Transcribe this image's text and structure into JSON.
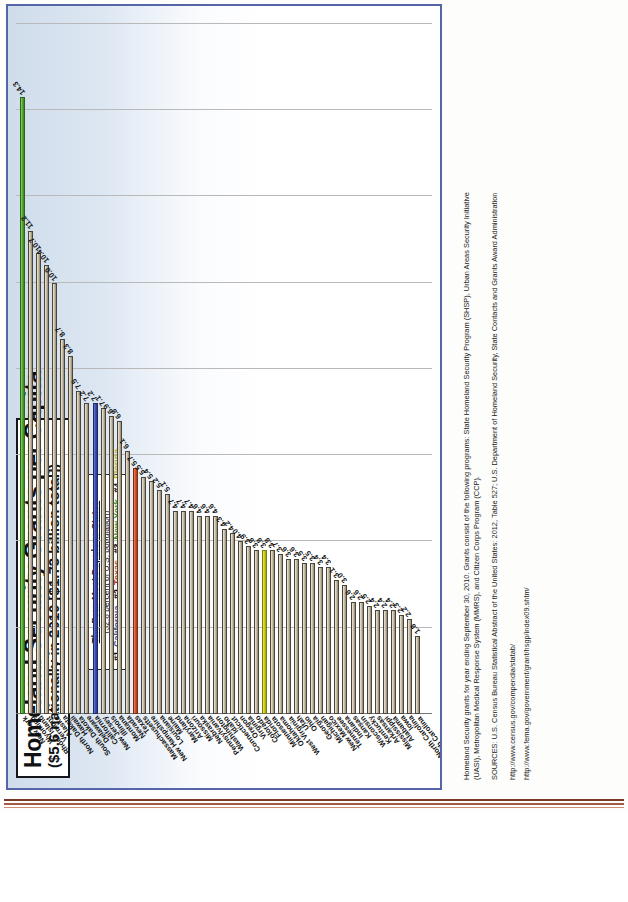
{
  "document": {
    "title_line1": "Homeland Security Grants per Capita",
    "title_line2": "($5.6 nationally in 2010 [$1.73 billion total])"
  },
  "legend": {
    "heading": "The Four Most Populous States",
    "subheading": "(32.8 percent of U.S. population)",
    "entries": [
      {
        "rank": "#1",
        "state": "California",
        "color": "#3b4ea8"
      },
      {
        "rank": "#2",
        "state": "Texas",
        "color": "#c0392b"
      },
      {
        "rank": "#3",
        "state": "New York",
        "color": "#2f8f2f"
      },
      {
        "rank": "#4",
        "state": "Florida",
        "color": "#b3b321"
      }
    ]
  },
  "notes": {
    "line1": "Homeland Security grants for year ending September 30, 2010. Grants consist of the following programs: State Homeland Security Program (SHSP), Urban Areas Security Initiative",
    "line2": "(UASI), Metropolitan Medical Response System (MMRS), and Citizen Corps Program (CCP).",
    "line3": "SOURCES: U.S. Census Bureau Statistical Abstract of the United States: 2012, Table 527; U.S. Department of Homeland Security, State Contacts and Grants Award Administration",
    "line4": "http://www.census.gov/compendia/statab/",
    "line5": "http://www.fema.gov/government/grant/hsgp/index09.shtm/"
  },
  "chart_data": {
    "type": "bar",
    "orientation": "horizontal",
    "title": "Homeland Security Grants per Capita",
    "subtitle": "($5.6 nationally in 2010 [$1.73 billion total])",
    "xlabel": "dollars per capita",
    "ylabel": "",
    "xlim": [
      0,
      16
    ],
    "xticks": [
      "0",
      "2",
      "4",
      "6",
      "8",
      "10",
      "12",
      "14",
      "16"
    ],
    "grid": true,
    "legend_position": "top-center",
    "value_label_format": "0.0",
    "categories": [
      "New York",
      "Wyoming",
      "Rhode Island",
      "Vermont",
      "Alaska",
      "North Dakota",
      "Hawaii",
      "South Dakota",
      "Delaware",
      "California",
      "New Jersey",
      "Illinois",
      "Montana",
      "Nevada",
      "Texas",
      "Massachusetts",
      "New Hampshire",
      "Louisiana",
      "Maine",
      "Maryland",
      "Arizona",
      "Missouri",
      "Nebraska",
      "Pennsylvania",
      "Washington",
      "Idaho",
      "Connecticut",
      "Oregon",
      "Virginia",
      "Colorado",
      "Florida",
      "Minnesota",
      "Oklahoma",
      "West Virginia",
      "Utah",
      "Ohio",
      "Georgia",
      "Michigan",
      "New Mexico",
      "Tennessee",
      "Indiana",
      "Kansas",
      "Wisconsin",
      "Kentucky",
      "Arkansas",
      "Mississippi",
      "Alabama",
      "Iowa",
      "North Carolina",
      "South Carolina"
    ],
    "values": [
      14.3,
      11.2,
      10.7,
      10.4,
      10.0,
      8.7,
      8.3,
      7.5,
      7.2,
      7.2,
      7.1,
      6.9,
      6.8,
      6.1,
      5.7,
      5.5,
      5.4,
      5.2,
      5.1,
      4.7,
      4.7,
      4.7,
      4.6,
      4.6,
      4.6,
      4.3,
      4.2,
      4.0,
      3.9,
      3.8,
      3.8,
      3.8,
      3.7,
      3.6,
      3.6,
      3.5,
      3.5,
      3.4,
      3.4,
      3.1,
      3.0,
      2.6,
      2.6,
      2.5,
      2.4,
      2.4,
      2.4,
      2.3,
      2.2,
      1.8
    ],
    "highlighted": {
      "New York": "#2f8f2f",
      "California": "#3b4ea8",
      "Texas": "#c0392b",
      "Florida": "#b3b321"
    },
    "national_average": 5.6
  }
}
